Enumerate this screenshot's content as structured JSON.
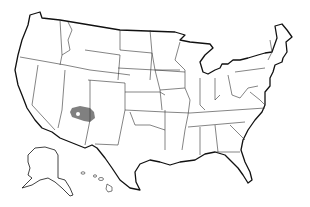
{
  "map": {
    "subject": "United States state outline map",
    "states_shown": "48 contiguous states plus Alaska and Hawaii insets",
    "highlighted_region": {
      "location": "northern Arizona",
      "color": "#808080"
    },
    "colors": {
      "background": "#ffffff",
      "borders": "#222222",
      "highlight": "#808080"
    }
  }
}
